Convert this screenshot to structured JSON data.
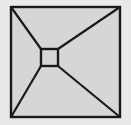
{
  "canvas": {
    "width": 131,
    "height": 125,
    "background_color": "#e9e9e9"
  },
  "figure": {
    "title": "Square with inscribed offset square and corner diagonals",
    "stroke_color": "#1a1a1a",
    "fill_color": "#d6d6d6",
    "outer_square": {
      "label": "outer-square",
      "x": 11,
      "y": 7,
      "width": 109,
      "height": 110,
      "stroke_width": 2.4,
      "fill": "#d6d6d6"
    },
    "inner_square": {
      "label": "inner-square",
      "x": 41,
      "y": 49,
      "width": 17,
      "height": 17,
      "stroke_width": 2.4,
      "fill": "#d6d6d6"
    },
    "diagonals": [
      {
        "label": "diagonal-top-left",
        "x1": 11,
        "y1": 7,
        "x2": 41,
        "y2": 49,
        "stroke_width": 2.2
      },
      {
        "label": "diagonal-top-right",
        "x1": 120,
        "y1": 7,
        "x2": 58,
        "y2": 49,
        "stroke_width": 2.2
      },
      {
        "label": "diagonal-bottom-left",
        "x1": 11,
        "y1": 117,
        "x2": 41,
        "y2": 66,
        "stroke_width": 2.2
      },
      {
        "label": "diagonal-bottom-right",
        "x1": 120,
        "y1": 117,
        "x2": 58,
        "y2": 66,
        "stroke_width": 2.2
      }
    ]
  }
}
